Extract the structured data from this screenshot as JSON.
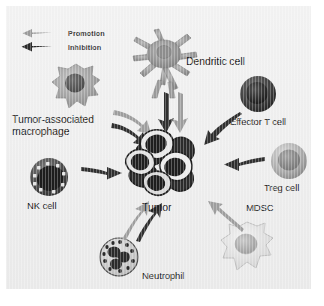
{
  "figure": {
    "background_color": "#eeeeee",
    "promotion_color": "#8d8d8d",
    "inhibition_color": "#2e2e2e"
  },
  "legend": {
    "items": [
      {
        "label": "Promotion",
        "arrow": "promotion-arrow-icon",
        "color": "#8d8d8d"
      },
      {
        "label": "Inhibition",
        "arrow": "inhibition-arrow-icon",
        "color": "#2b2b2b"
      }
    ]
  },
  "center": {
    "label": "Tumor",
    "icon": "tumor-cell-cluster-icon"
  },
  "cells": [
    {
      "id": "tumor-associated-macrophage",
      "label": "Tumor-associated\nmacrophage",
      "icon": "macrophage-icon",
      "color": "#9a9a9a"
    },
    {
      "id": "dendritic-cell",
      "label": "Dendritic cell",
      "icon": "dendritic-cell-icon",
      "color": "#8e8e8e"
    },
    {
      "id": "effector-t-cell",
      "label": "Effector T cell",
      "icon": "effector-t-cell-icon",
      "color": "#3a3a3a"
    },
    {
      "id": "treg-cell",
      "label": "Treg cell",
      "icon": "treg-cell-icon",
      "color": "#a8a8a8"
    },
    {
      "id": "mdsc",
      "label": "MDSC",
      "icon": "mdsc-icon",
      "color": "#dcdcdc"
    },
    {
      "id": "neutrophil",
      "label": "Neutrophil",
      "icon": "neutrophil-icon",
      "color": "#cfcfcf"
    },
    {
      "id": "nk-cell",
      "label": "NK cell",
      "icon": "nk-cell-icon",
      "color": "#4a4a4a"
    }
  ],
  "interactions": [
    {
      "from": "tumor-associated-macrophage",
      "to": "tumor",
      "type": "Promotion"
    },
    {
      "from": "tumor-associated-macrophage",
      "to": "tumor",
      "type": "Inhibition"
    },
    {
      "from": "dendritic-cell",
      "to": "tumor",
      "type": "Inhibition"
    },
    {
      "from": "dendritic-cell",
      "to": "tumor",
      "type": "Promotion"
    },
    {
      "from": "effector-t-cell",
      "to": "tumor",
      "type": "Inhibition"
    },
    {
      "from": "treg-cell",
      "to": "tumor",
      "type": "Inhibition"
    },
    {
      "from": "nk-cell",
      "to": "tumor",
      "type": "Inhibition"
    },
    {
      "from": "neutrophil",
      "to": "tumor",
      "type": "Promotion"
    },
    {
      "from": "neutrophil",
      "to": "tumor",
      "type": "Inhibition"
    },
    {
      "from": "mdsc",
      "to": "tumor",
      "type": "Promotion"
    }
  ]
}
